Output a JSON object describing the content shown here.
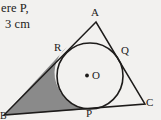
{
  "figure": {
    "background_color": "#f2f1ef",
    "stroke_color": "#1d1b1a",
    "shaded_region_color": "#8a8a8a",
    "prose": {
      "line_1": "ere P,",
      "line_2": "3 cm"
    },
    "labels": {
      "apex": "A",
      "tangent_left": "R",
      "tangent_right": "Q",
      "center": "O",
      "tangent_bottom": "P",
      "vertex_right": "C",
      "vertex_left": "B"
    },
    "geometry": {
      "triangle_vertices": {
        "A": [
          96,
          22
        ],
        "B": [
          4,
          115
        ],
        "C": [
          145,
          104
        ]
      },
      "incircle": {
        "center": [
          90,
          76
        ],
        "radius": 33
      },
      "tangent_points": {
        "R": [
          67,
          47
        ],
        "Q": [
          117,
          50
        ],
        "P": [
          91,
          109
        ]
      },
      "shaded_description": "region bounded by side AB, side BC and the circle arc"
    }
  }
}
